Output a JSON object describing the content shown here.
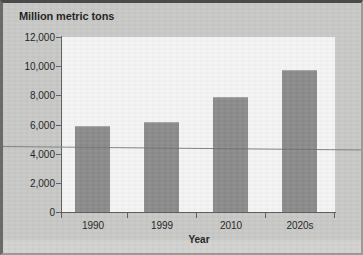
{
  "chart_data": {
    "type": "bar",
    "title": "Million metric tons",
    "xlabel": "Year",
    "ylabel": "",
    "categories": [
      "1990",
      "1999",
      "2010",
      "2020s"
    ],
    "values": [
      5900,
      6150,
      7900,
      9750
    ],
    "ylim": [
      0,
      12000
    ],
    "yticks": [
      0,
      2000,
      4000,
      6000,
      8000,
      10000,
      12000
    ],
    "ytick_labels": [
      "0",
      "2,000",
      "4,000",
      "6,000",
      "8,000",
      "10,000",
      "12,000"
    ],
    "grid": false,
    "legend": null,
    "bar_color": "#8a8a8a",
    "plot_background": "#f6f6f6",
    "page_background": "#c9c9c7",
    "axis_color": "#5b5b5b",
    "annotations": [
      {
        "name": "scan-artifact-line",
        "description": "thin dark horizontal line crossing the full image near the 4,500 level"
      }
    ]
  }
}
